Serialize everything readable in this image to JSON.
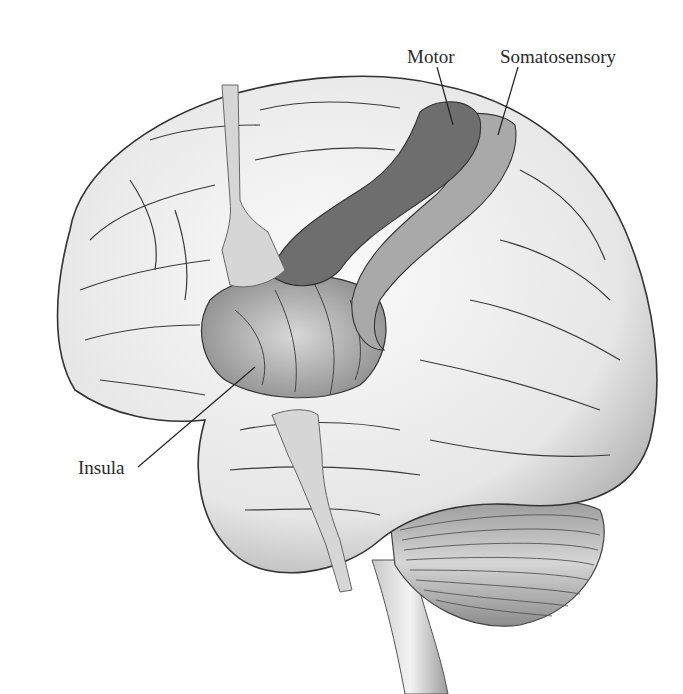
{
  "figure": {
    "labels": {
      "motor": "Motor",
      "somatosensory": "Somatosensory",
      "insula": "Insula"
    },
    "colors": {
      "background": "#ffffff",
      "cortex": "#f2f2f2",
      "cortex_shadow": "#b8b8b8",
      "sulcus_line": "#3a3a3a",
      "motor_cortex": "#6e6e6e",
      "somatosensory_cortex": "#a9a9a9",
      "retractor": "#d6d6d6",
      "cerebellum": "#cfcfcf",
      "leader_line": "#222222",
      "label_text": "#2a2a2a"
    }
  }
}
